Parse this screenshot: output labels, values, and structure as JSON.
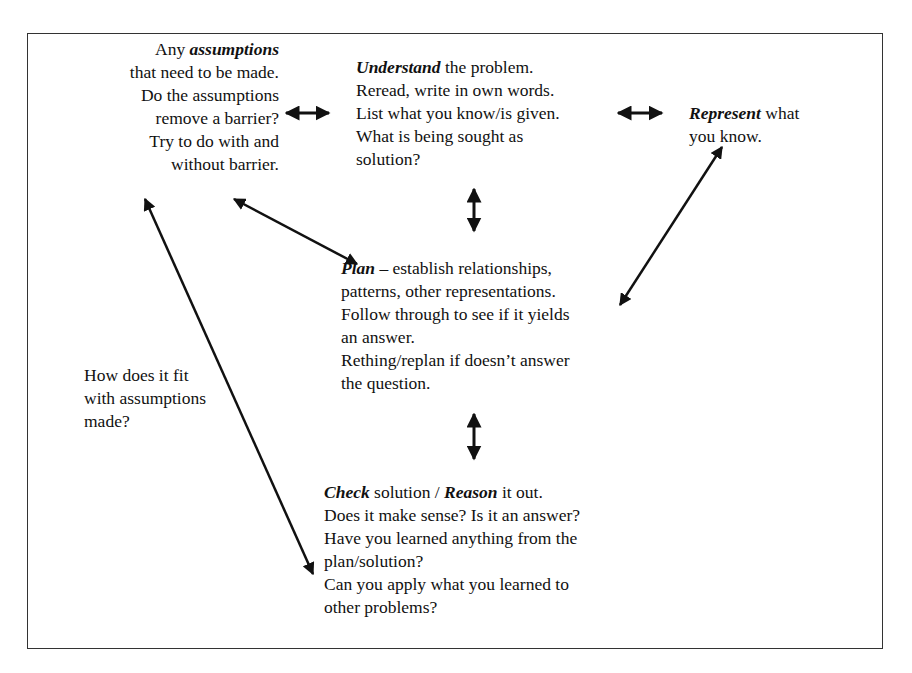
{
  "diagram": {
    "assumptions": {
      "keyword": "assumptions",
      "line1_prefix": "Any ",
      "lines": [
        "that need to be made.",
        "Do the assumptions",
        "remove a barrier?",
        "Try to do with and",
        "without barrier."
      ]
    },
    "understand": {
      "keyword": "Understand",
      "line1_suffix": " the problem.",
      "lines": [
        "Reread, write in own words.",
        "List what you know/is given.",
        "What is being sought as",
        "solution?"
      ]
    },
    "represent": {
      "keyword": "Represent",
      "line1_suffix": " what",
      "lines": [
        "you know."
      ]
    },
    "plan": {
      "keyword": "Plan",
      "line1_suffix": " – establish relationships,",
      "lines": [
        "patterns, other representations.",
        "Follow through to see if it yields",
        "an answer.",
        "Rething/replan if doesn’t answer",
        "the question."
      ]
    },
    "fit": {
      "lines": [
        "How does it fit",
        "with assumptions",
        "made?"
      ]
    },
    "check": {
      "keyword1": "Check",
      "mid": " solution / ",
      "keyword2": "Reason",
      "line1_suffix": " it out.",
      "lines": [
        "Does it make sense? Is it an answer?",
        "Have you learned anything from the",
        "plan/solution?",
        "Can you apply what you learned to",
        "other problems?"
      ]
    },
    "arrows": [
      {
        "name": "assumptions-understand",
        "from": "assumptions",
        "to": "understand",
        "type": "double"
      },
      {
        "name": "understand-represent",
        "from": "understand",
        "to": "represent",
        "type": "double"
      },
      {
        "name": "understand-plan",
        "from": "understand",
        "to": "plan",
        "type": "double"
      },
      {
        "name": "assumptions-plan",
        "from": "assumptions",
        "to": "plan",
        "type": "double"
      },
      {
        "name": "represent-plan",
        "from": "represent",
        "to": "plan",
        "type": "double"
      },
      {
        "name": "plan-check",
        "from": "plan",
        "to": "check",
        "type": "double"
      },
      {
        "name": "assumptions-check",
        "from": "assumptions",
        "to": "check",
        "type": "double"
      }
    ],
    "colors": {
      "ink": "#111111",
      "frame": "#333333",
      "background": "#ffffff"
    }
  }
}
